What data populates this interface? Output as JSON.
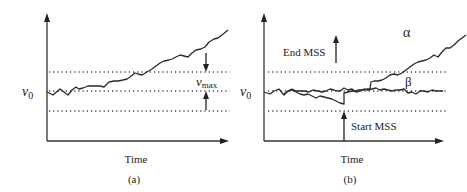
{
  "figure": {
    "panel_a": {
      "caption": "(a)",
      "x_axis_label": "Time",
      "y_level_label": "v",
      "y_level_subscript": "0",
      "threshold_label": "v",
      "threshold_subscript": "max"
    },
    "panel_b": {
      "caption": "(b)",
      "x_axis_label": "Time",
      "y_level_label": "v",
      "y_level_subscript": "0",
      "curve_alpha_label": "α",
      "curve_beta_label": "β",
      "start_label": "Start MSS",
      "end_label": "End MSS"
    },
    "colors": {
      "line": "#2a2a2a",
      "background": "#ffffff"
    }
  }
}
